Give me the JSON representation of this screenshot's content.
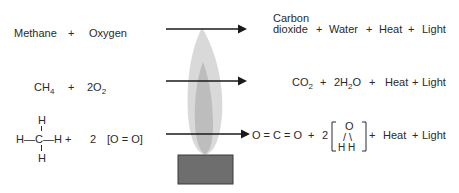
{
  "diagram": {
    "colors": {
      "text": "#2a2a2a",
      "arrow": "#1a1a1a",
      "outer_flame": "#d9d9d9",
      "inner_flame": "#bdbdbd",
      "burner": "#6e6e6e",
      "burner_border": "#3a3a3a"
    },
    "row_words": {
      "reactant1": "Methane",
      "plus1": "+",
      "reactant2": "Oxygen",
      "product1_line1": "Carbon",
      "product1_line2": "dioxide",
      "plus2": "+",
      "product2": "Water",
      "plus3": "+",
      "product3": "Heat",
      "plus4": "+",
      "product4": "Light"
    },
    "row_formula": {
      "reactant1_main": "CH",
      "reactant1_sub": "4",
      "plus1": "+",
      "reactant2_coef": "2O",
      "reactant2_sub": "2",
      "product1_main": "CO",
      "product1_sub": "2",
      "plus2": "+",
      "product2_pre": "2H",
      "product2_sub": "2",
      "product2_post": "O",
      "plus3": "+",
      "product3": "Heat",
      "plus4": "+",
      "product4": "Light"
    },
    "row_structure": {
      "methane_top_h": "H",
      "methane_bottom_h": "H",
      "methane_row": "H—C—H +",
      "oxygen_coef": "2",
      "oxygen_struct": "[O = O]",
      "co2_struct": "O = C = O",
      "plus2": "+",
      "water_coef": "2",
      "water_o": "O",
      "water_bonds": "/ \\",
      "water_h": "H  H",
      "plus3": "+",
      "product3": "Heat",
      "plus4": "+",
      "product4": "Light"
    }
  }
}
